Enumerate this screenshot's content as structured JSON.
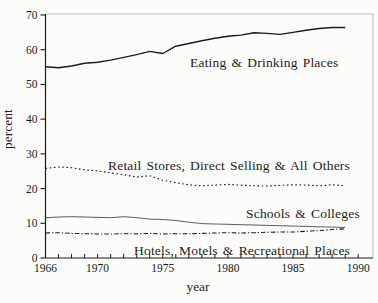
{
  "figure": {
    "background": "#fcfcfa",
    "axis_color": "#1a1a1a",
    "frame_color": "#bdbdbd"
  },
  "chart_data": {
    "type": "line",
    "title": "",
    "xlabel": "year",
    "ylabel": "percent",
    "xlim": [
      1966,
      1991.2
    ],
    "ylim": [
      0,
      70
    ],
    "grid": "off",
    "legend_position": "inline-labels-on-plot",
    "yticks": [
      0,
      10,
      20,
      30,
      40,
      50,
      60,
      70
    ],
    "xticks_labeled": [
      1966,
      1970,
      1975,
      1980,
      1985,
      1990
    ],
    "xticks_minor_every_years": 1,
    "x": [
      1966,
      1967,
      1968,
      1969,
      1970,
      1971,
      1972,
      1973,
      1974,
      1975,
      1976,
      1977,
      1978,
      1979,
      1980,
      1981,
      1982,
      1983,
      1984,
      1985,
      1986,
      1987,
      1988,
      1989
    ],
    "series": [
      {
        "name": "Eating & Drinking Places",
        "style": "solid",
        "color": "#1c1c1c",
        "values": [
          55.1,
          54.8,
          55.3,
          56.1,
          56.4,
          57.0,
          57.8,
          58.6,
          59.5,
          58.9,
          61.0,
          61.8,
          62.6,
          63.3,
          63.9,
          64.2,
          64.9,
          64.7,
          64.4,
          65.0,
          65.6,
          66.1,
          66.4,
          66.4
        ]
      },
      {
        "name": "Retail Stores, Direct Selling & All Others",
        "style": "dotted",
        "color": "#1c1c1c",
        "values": [
          25.8,
          26.2,
          26.0,
          25.4,
          25.1,
          24.5,
          24.0,
          23.3,
          23.7,
          22.4,
          21.7,
          21.1,
          20.8,
          21.0,
          21.2,
          21.0,
          20.8,
          20.7,
          20.9,
          21.1,
          21.0,
          20.8,
          21.1,
          20.8
        ]
      },
      {
        "name": "Schools & Colleges",
        "style": "solid-thin",
        "color": "#4a4a4a",
        "values": [
          11.6,
          11.8,
          11.9,
          11.8,
          11.7,
          11.6,
          11.9,
          11.6,
          11.2,
          11.1,
          10.8,
          10.3,
          9.9,
          9.8,
          9.7,
          9.6,
          9.5,
          9.4,
          9.3,
          9.2,
          9.1,
          9.0,
          8.9,
          8.8
        ]
      },
      {
        "name": "Hotels, Motels & Recreational Places",
        "style": "dashdot",
        "color": "#1c1c1c",
        "values": [
          7.2,
          7.3,
          7.1,
          7.0,
          6.9,
          6.9,
          7.0,
          7.0,
          7.1,
          6.9,
          7.0,
          7.0,
          7.1,
          7.2,
          7.3,
          7.2,
          7.3,
          7.4,
          7.5,
          7.5,
          7.7,
          7.9,
          8.2,
          8.4
        ]
      }
    ]
  }
}
